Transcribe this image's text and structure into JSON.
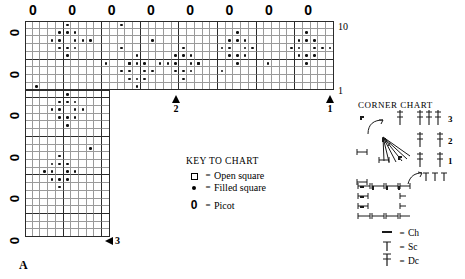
{
  "chart": {
    "label_a": "A",
    "top_right_label": "10",
    "bottom_right_label": "1",
    "picot_symbol": "0",
    "picots_top": [
      "0",
      "0",
      "0",
      "0",
      "0",
      "0",
      "0",
      "0"
    ],
    "picots_left": [
      "0",
      "0",
      "0",
      "0",
      "0",
      "0"
    ],
    "arrows": [
      {
        "name": "arrow-2",
        "label": "2",
        "direction": "up"
      },
      {
        "name": "arrow-1",
        "label": "1",
        "direction": "up"
      },
      {
        "name": "arrow-3",
        "label": "3",
        "direction": "left"
      }
    ]
  },
  "key": {
    "title": "KEY TO CHART",
    "equals": "=",
    "rows": [
      {
        "symbol": "open-square",
        "label": "Open square"
      },
      {
        "symbol": "filled-dot",
        "label": "Filled square"
      },
      {
        "symbol": "picot",
        "label": "Picot"
      }
    ]
  },
  "corner_chart": {
    "title": "CORNER CHART",
    "row_numbers": [
      "3",
      "2",
      "1"
    ],
    "equals": "=",
    "legend": [
      {
        "symbol": "ch-dash",
        "label": "Ch"
      },
      {
        "symbol": "sc-tee",
        "label": "Sc"
      },
      {
        "symbol": "dc-cross",
        "label": "Dc"
      }
    ]
  },
  "chart_data": {
    "type": "heatmap",
    "cell": 7.72,
    "grid_top": {
      "cols": 40,
      "rows": 9,
      "x": 0,
      "y": 0
    },
    "grid_left": {
      "cols": 11,
      "rows": 19,
      "x": 0,
      "y": 9
    },
    "filled_cells": [
      [
        5,
        1
      ],
      [
        4,
        2
      ],
      [
        5,
        2
      ],
      [
        6,
        2
      ],
      [
        3,
        3
      ],
      [
        4,
        3
      ],
      [
        6,
        3
      ],
      [
        7,
        3
      ],
      [
        8,
        3
      ],
      [
        4,
        4
      ],
      [
        5,
        4
      ],
      [
        6,
        4
      ],
      [
        5,
        5
      ],
      [
        12,
        1
      ],
      [
        12,
        4
      ],
      [
        16,
        3
      ],
      [
        10,
        6
      ],
      [
        13,
        6
      ],
      [
        17,
        6
      ],
      [
        22,
        6
      ],
      [
        25,
        7
      ],
      [
        31,
        6
      ],
      [
        20,
        4
      ],
      [
        19,
        5
      ],
      [
        20,
        5
      ],
      [
        21,
        5
      ],
      [
        18,
        6
      ],
      [
        19,
        6
      ],
      [
        21,
        6
      ],
      [
        22,
        6
      ],
      [
        19,
        7
      ],
      [
        20,
        7
      ],
      [
        21,
        7
      ],
      [
        20,
        8
      ],
      [
        14,
        5
      ],
      [
        13,
        6
      ],
      [
        14,
        6
      ],
      [
        15,
        6
      ],
      [
        12,
        7
      ],
      [
        13,
        7
      ],
      [
        15,
        7
      ],
      [
        16,
        7
      ],
      [
        13,
        8
      ],
      [
        14,
        8
      ],
      [
        15,
        8
      ],
      [
        14,
        9
      ],
      [
        27,
        2
      ],
      [
        26,
        3
      ],
      [
        27,
        3
      ],
      [
        28,
        3
      ],
      [
        25,
        4
      ],
      [
        26,
        4
      ],
      [
        28,
        4
      ],
      [
        29,
        4
      ],
      [
        26,
        5
      ],
      [
        27,
        5
      ],
      [
        28,
        5
      ],
      [
        27,
        6
      ],
      [
        36,
        2
      ],
      [
        35,
        3
      ],
      [
        36,
        3
      ],
      [
        37,
        3
      ],
      [
        34,
        4
      ],
      [
        35,
        4
      ],
      [
        37,
        4
      ],
      [
        38,
        4
      ],
      [
        39,
        4
      ],
      [
        35,
        5
      ],
      [
        36,
        5
      ],
      [
        37,
        5
      ],
      [
        36,
        6
      ],
      [
        1,
        9
      ],
      [
        5,
        10
      ],
      [
        4,
        11
      ],
      [
        5,
        11
      ],
      [
        6,
        11
      ],
      [
        3,
        12
      ],
      [
        4,
        12
      ],
      [
        6,
        12
      ],
      [
        7,
        12
      ],
      [
        4,
        13
      ],
      [
        5,
        13
      ],
      [
        6,
        13
      ],
      [
        5,
        14
      ],
      [
        8,
        17
      ],
      [
        4,
        18
      ],
      [
        3,
        19
      ],
      [
        4,
        19
      ],
      [
        5,
        19
      ],
      [
        2,
        20
      ],
      [
        3,
        20
      ],
      [
        5,
        20
      ],
      [
        6,
        20
      ],
      [
        3,
        21
      ],
      [
        4,
        21
      ],
      [
        5,
        21
      ],
      [
        4,
        22
      ]
    ]
  }
}
